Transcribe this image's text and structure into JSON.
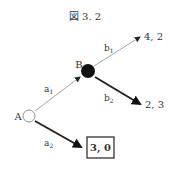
{
  "title": "図 3. 2",
  "nodes": {
    "A": {
      "label": "A",
      "style": "hollow"
    },
    "B": {
      "label": "B",
      "style": "filled"
    }
  },
  "edges": {
    "a1": {
      "label": "a",
      "sub": "1",
      "from": "A",
      "to": "B",
      "bold": false
    },
    "a2": {
      "label": "a",
      "sub": "2",
      "from": "A",
      "to": "payoff_a2",
      "bold": true
    },
    "b1": {
      "label": "b",
      "sub": "1",
      "from": "B",
      "to": "payoff_b1",
      "bold": false
    },
    "b2": {
      "label": "b",
      "sub": "2",
      "from": "B",
      "to": "payoff_b2",
      "bold": true
    }
  },
  "payoffs": {
    "b1": "4, 2",
    "b2": "2, 3",
    "a2": "3, 0"
  },
  "highlighted_payoff": "a2",
  "colors": {
    "thin_edge": "#999999",
    "bold_edge": "#222222",
    "node_fill": "#111111"
  }
}
